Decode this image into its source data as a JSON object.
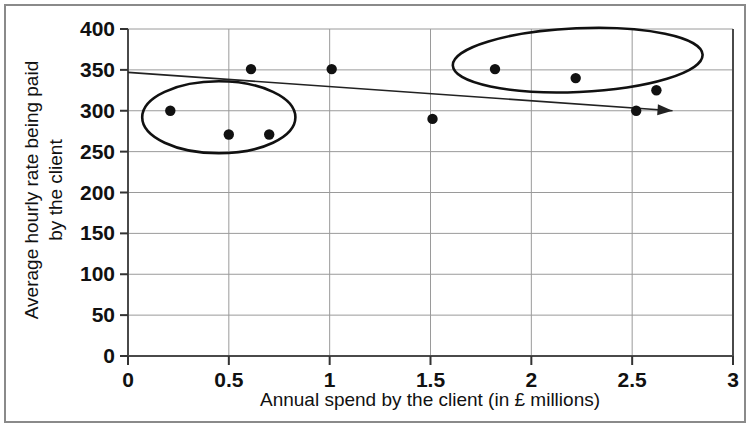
{
  "chart_data": {
    "type": "scatter",
    "title": "",
    "xlabel": "Annual spend by the client (in £ millions)",
    "ylabel": "Average hourly rate being paid by the client",
    "ylabel_line1": "Average hourly rate being paid",
    "ylabel_line2": "by the client",
    "xlim": [
      0,
      3
    ],
    "ylim": [
      0,
      400
    ],
    "xticks": [
      0,
      0.5,
      1,
      1.5,
      2,
      2.5,
      3
    ],
    "xtick_labels": [
      "0",
      "0.5",
      "1",
      "1.5",
      "2",
      "2.5",
      "3"
    ],
    "yticks": [
      0,
      50,
      100,
      150,
      200,
      250,
      300,
      350,
      400
    ],
    "ytick_labels": [
      "0",
      "50",
      "100",
      "150",
      "200",
      "250",
      "300",
      "350",
      "400"
    ],
    "grid": true,
    "grid_axis": "both",
    "legend": "none",
    "points": [
      {
        "x": 0.21,
        "y": 300
      },
      {
        "x": 0.5,
        "y": 271
      },
      {
        "x": 0.61,
        "y": 351
      },
      {
        "x": 0.7,
        "y": 271
      },
      {
        "x": 1.01,
        "y": 351
      },
      {
        "x": 1.51,
        "y": 290
      },
      {
        "x": 1.82,
        "y": 351
      },
      {
        "x": 2.22,
        "y": 340
      },
      {
        "x": 2.52,
        "y": 300
      },
      {
        "x": 2.62,
        "y": 325
      }
    ],
    "series": [
      {
        "name": "clients",
        "marker": "filled-circle",
        "color": "#111111",
        "x": [
          0.21,
          0.5,
          0.61,
          0.7,
          1.01,
          1.51,
          1.82,
          2.22,
          2.52,
          2.62
        ],
        "values": [
          300,
          271,
          351,
          271,
          351,
          290,
          351,
          340,
          300,
          325
        ]
      }
    ],
    "trendline": {
      "label": "trend arrow",
      "from": {
        "x": 0.0,
        "y": 347
      },
      "to": {
        "x": 2.7,
        "y": 300
      },
      "arrow": true,
      "color": "#222222"
    },
    "annotations": [
      {
        "type": "ellipse",
        "name": "low-spend-cluster",
        "center": {
          "x": 0.45,
          "y": 292
        },
        "radius_x": 0.38,
        "radius_y": 44,
        "rotation_deg": 0,
        "color": "#111111"
      },
      {
        "type": "ellipse",
        "name": "high-spend-cluster",
        "center": {
          "x": 2.23,
          "y": 362
        },
        "radius_x": 0.62,
        "radius_y": 39,
        "rotation_deg": -2.5,
        "color": "#111111"
      }
    ]
  },
  "figure": {
    "background_color": "#ffffff",
    "border_color": "#8a8a8a",
    "grid_color": "#9a9a9a",
    "axis_color": "#4a4a4a"
  }
}
